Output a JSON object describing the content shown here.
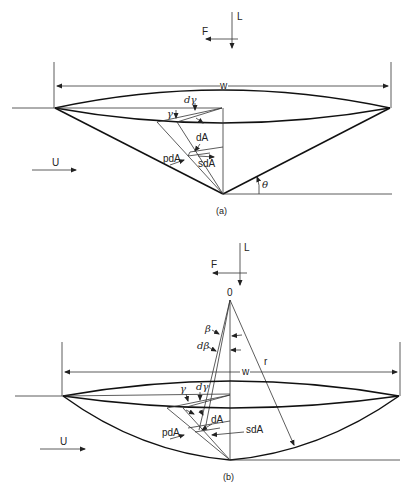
{
  "figure_a": {
    "caption": "(a)",
    "force_labels": {
      "lift": "L",
      "drag": "F"
    },
    "width_label": "w",
    "freestream_label": "U",
    "angles": {
      "gamma": "γ",
      "dgamma": "dγ",
      "theta": "θ"
    },
    "element_labels": {
      "dA": "dA",
      "pdA": "pdA",
      "sdA": "sdA"
    }
  },
  "figure_b": {
    "caption": "(b)",
    "force_labels": {
      "lift": "L",
      "drag": "F"
    },
    "origin_label": "0",
    "radius_label": "r",
    "width_label": "w",
    "freestream_label": "U",
    "angles": {
      "beta": "β",
      "dbeta": "dβ",
      "gamma": "γ",
      "dgamma": "dγ"
    },
    "element_labels": {
      "dA": "dA",
      "pdA": "pdA",
      "sdA": "sdA"
    }
  }
}
